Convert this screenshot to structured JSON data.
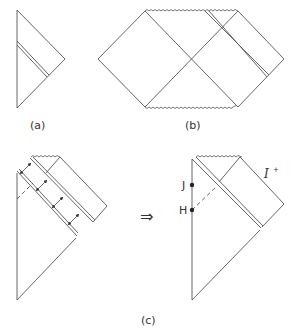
{
  "panels": {
    "a": {
      "label": "(a)"
    },
    "b": {
      "label": "(b)"
    },
    "c": {
      "label": "(c)",
      "implies_symbol": "⇒",
      "point_labels": {
        "J": "J",
        "H": "H"
      },
      "scri_label": "I",
      "scri_superscript": "+"
    }
  },
  "colors": {
    "line": "#555555",
    "text": "#333333",
    "background": "#ffffff"
  }
}
